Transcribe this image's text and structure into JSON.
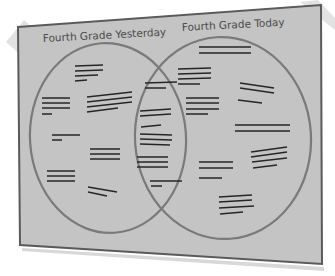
{
  "diagram": {
    "type": "venn",
    "circles": [
      {
        "label": "Fourth Grade Yesterday",
        "position": "left"
      },
      {
        "label": "Fourth Grade Today",
        "position": "right"
      }
    ],
    "content": "placeholder text lines (illegible)",
    "colors": {
      "board": "#c4c4c4",
      "board_border": "#5a5a5a",
      "circle_stroke": "#7a7a7a",
      "text_lines": "#262626",
      "tape": "#e2e2e2",
      "label_text": "#4a4a4a"
    }
  }
}
